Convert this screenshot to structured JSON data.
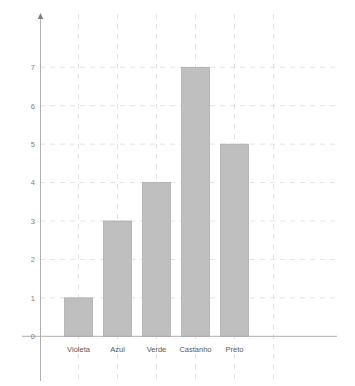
{
  "chart_data": {
    "type": "bar",
    "title": "",
    "subtitle": "",
    "xlabel": "",
    "ylabel": "",
    "categories": [
      "Violeta",
      "Azul",
      "Verde",
      "Castanho",
      "Preto"
    ],
    "values": [
      1,
      3,
      4,
      7,
      5
    ],
    "series": [
      {
        "name": "Contagem",
        "values": [
          1,
          3,
          4,
          7,
          5
        ]
      }
    ],
    "ylim": [
      0,
      7
    ],
    "ytick_labels": [
      "0",
      "1",
      "2",
      "3",
      "4",
      "5",
      "6",
      "7"
    ],
    "ytick_values": [
      0,
      1,
      2,
      3,
      4,
      5,
      6,
      7
    ],
    "grid": true,
    "grid_style": "dashed",
    "legend": false,
    "legend_position": "none",
    "annotations": [],
    "colors": {
      "bar_fill": "#bfbfbf",
      "bar_stroke": "#a6a6a6",
      "gridline": "#d8d8d8",
      "axis": "#a6a6a6",
      "tick_text": "#808080",
      "category_text": "#595959",
      "background": "#ffffff"
    }
  },
  "axes": {
    "y_axis_name": "value-axis",
    "x_axis_name": "category-axis",
    "has_y_arrow": true
  }
}
